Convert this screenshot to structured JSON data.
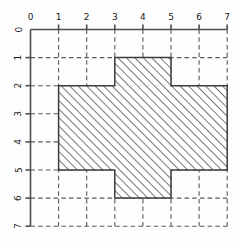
{
  "figure": {
    "background_color": "#fdfdfd",
    "axis_color": "#4d4d4d",
    "grid_color": "#5a5a5a",
    "outline_color": "#3c3c3c",
    "hatch_color": "#5e5e5e"
  },
  "chart_data": {
    "type": "area",
    "title": "",
    "xlabel": "",
    "ylabel": "",
    "xlim": [
      0,
      7
    ],
    "ylim": [
      0,
      7
    ],
    "y_axis_inverted": true,
    "grid": true,
    "grid_style": "dashed",
    "legend": null,
    "x_ticks": [
      0,
      1,
      2,
      3,
      4,
      5,
      6,
      7
    ],
    "y_ticks": [
      0,
      1,
      2,
      3,
      4,
      5,
      6,
      7
    ],
    "x_tick_labels": [
      "0",
      "1",
      "2",
      "3",
      "4",
      "5",
      "6",
      "7"
    ],
    "y_tick_labels": [
      "0",
      "1",
      "2",
      "3",
      "4",
      "5",
      "6",
      "7"
    ],
    "x_axis_position": "top",
    "y_axis_position": "left",
    "y_tick_label_rotation": 90,
    "shapes": [
      {
        "name": "top-block",
        "type": "rectangle",
        "x0": 3,
        "y0": 1,
        "x1": 5,
        "y1": 2,
        "fill": "hatched",
        "hatch": "diagonal-forward"
      },
      {
        "name": "main-rectangle",
        "type": "rectangle",
        "x0": 1,
        "y0": 2,
        "x1": 7,
        "y1": 5,
        "fill": "hatched",
        "hatch": "diagonal-forward"
      },
      {
        "name": "bottom-block",
        "type": "rectangle",
        "x0": 3,
        "y0": 5,
        "x1": 5,
        "y1": 6,
        "fill": "hatched",
        "hatch": "diagonal-forward"
      }
    ],
    "outline_polygon": [
      [
        3,
        1
      ],
      [
        5,
        1
      ],
      [
        5,
        2
      ],
      [
        7,
        2
      ],
      [
        7,
        5
      ],
      [
        5,
        5
      ],
      [
        5,
        6
      ],
      [
        3,
        6
      ],
      [
        3,
        5
      ],
      [
        1,
        5
      ],
      [
        1,
        2
      ],
      [
        3,
        2
      ]
    ]
  }
}
